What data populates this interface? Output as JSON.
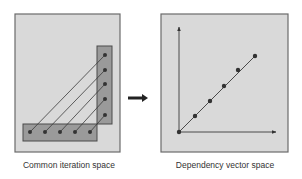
{
  "panels": {
    "left": {
      "caption": "Common iteration space",
      "frame": {
        "x": 15,
        "y": 14,
        "w": 105,
        "h": 138
      },
      "vertical_bar": {
        "x": 97,
        "y": 46,
        "w": 15,
        "h": 78
      },
      "horizontal_bar": {
        "x": 23,
        "y": 124,
        "w": 74,
        "h": 17
      },
      "bottom_points": [
        [
          30,
          132
        ],
        [
          45,
          132
        ],
        [
          60,
          132
        ],
        [
          75,
          132
        ],
        [
          90,
          132
        ]
      ],
      "right_points": [
        [
          105,
          55
        ],
        [
          105,
          70
        ],
        [
          105,
          84
        ],
        [
          105,
          99
        ],
        [
          105,
          115
        ]
      ]
    },
    "right": {
      "caption": "Dependency vector space",
      "frame": {
        "x": 161,
        "y": 14,
        "w": 127,
        "h": 138
      },
      "origin": [
        179,
        132
      ],
      "y_axis_end": [
        179,
        27
      ],
      "x_axis_end": [
        276,
        132
      ],
      "diagonal_points": [
        [
          179,
          132
        ],
        [
          195,
          116
        ],
        [
          210,
          101
        ],
        [
          224,
          86
        ],
        [
          238,
          70
        ],
        [
          255,
          56
        ]
      ]
    }
  },
  "arrow": {
    "from": [
      128,
      98
    ],
    "to": [
      148,
      98
    ]
  },
  "colors": {
    "frame_fill": "#d9d9d9",
    "frame_stroke": "#6b6b6b",
    "bar_fill": "#9a9a9a",
    "bar_stroke": "#4a4a4a",
    "point": "#333333",
    "line": "#3a3a3a"
  }
}
